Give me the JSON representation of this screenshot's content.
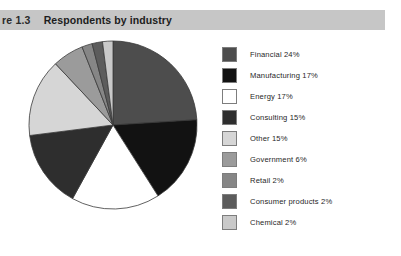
{
  "caption": {
    "number": "re 1.3",
    "title": "Respondents by industry",
    "band_color": "#c6c6c6"
  },
  "chart_data": {
    "type": "pie",
    "title": "Respondents by industry",
    "units": "percent",
    "start_angle_deg": 0,
    "direction": "clockwise",
    "legend_position": "right",
    "grid": false,
    "total": 100,
    "categories": [
      "Financial",
      "Manufacturing",
      "Energy",
      "Consulting",
      "Other",
      "Government",
      "Retail",
      "Consumer products",
      "Chemical"
    ],
    "values": [
      24,
      17,
      17,
      15,
      15,
      6,
      2,
      2,
      2
    ],
    "colors": [
      "#4d4d4d",
      "#121212",
      "#ffffff",
      "#2e2e2e",
      "#d6d6d6",
      "#9b9b9b",
      "#868686",
      "#5c5c5c",
      "#c9c9c9"
    ],
    "slice_outline": "#3a3a3a"
  },
  "legend": {
    "items": [
      {
        "label": "Financial 24%",
        "color": "#4d4d4d"
      },
      {
        "label": "Manufacturing 17%",
        "color": "#121212"
      },
      {
        "label": "Energy 17%",
        "color": "#ffffff"
      },
      {
        "label": "Consulting 15%",
        "color": "#2e2e2e"
      },
      {
        "label": "Other 15%",
        "color": "#d6d6d6"
      },
      {
        "label": "Government 6%",
        "color": "#9b9b9b"
      },
      {
        "label": "Retail 2%",
        "color": "#868686"
      },
      {
        "label": "Consumer products 2%",
        "color": "#5c5c5c"
      },
      {
        "label": "Chemical 2%",
        "color": "#c9c9c9"
      }
    ]
  }
}
